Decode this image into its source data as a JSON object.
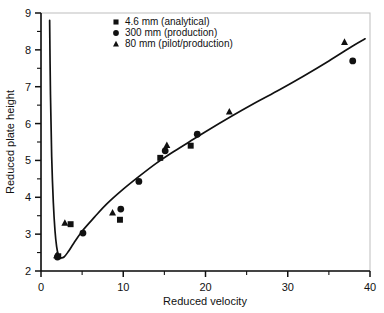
{
  "chart_data": {
    "type": "scatter",
    "title": "",
    "xlabel": "Reduced velocity",
    "ylabel": "Reduced plate height",
    "xlim": [
      0,
      40
    ],
    "ylim": [
      2,
      9
    ],
    "xticks": [
      "0",
      "10",
      "20",
      "30",
      "40"
    ],
    "xtick_values": [
      0,
      10,
      20,
      30,
      40
    ],
    "xminor_step": 5,
    "yticks": [
      "2",
      "3",
      "4",
      "5",
      "6",
      "7",
      "8",
      "9"
    ],
    "ytick_values": [
      2,
      3,
      4,
      5,
      6,
      7,
      8,
      9
    ],
    "yminor_step": 0.5,
    "grid": false,
    "legend_position": "top-center",
    "series": [
      {
        "name": "4.6 mm (analytical)",
        "marker": "square",
        "color": "#111111",
        "points": [
          {
            "x": 2.1,
            "y": 2.4
          },
          {
            "x": 3.6,
            "y": 3.27
          },
          {
            "x": 9.6,
            "y": 3.39
          },
          {
            "x": 14.5,
            "y": 5.07
          },
          {
            "x": 18.2,
            "y": 5.4
          }
        ]
      },
      {
        "name": "300 mm (production)",
        "marker": "circle",
        "color": "#111111",
        "points": [
          {
            "x": 2.0,
            "y": 2.38
          },
          {
            "x": 5.1,
            "y": 3.03
          },
          {
            "x": 9.7,
            "y": 3.68
          },
          {
            "x": 11.9,
            "y": 4.43
          },
          {
            "x": 15.1,
            "y": 5.26
          },
          {
            "x": 19.0,
            "y": 5.71
          },
          {
            "x": 37.9,
            "y": 7.7
          }
        ]
      },
      {
        "name": "80 mm (pilot/production)",
        "marker": "triangle",
        "color": "#111111",
        "points": [
          {
            "x": 1.9,
            "y": 2.42
          },
          {
            "x": 2.9,
            "y": 3.3
          },
          {
            "x": 8.7,
            "y": 3.58
          },
          {
            "x": 15.3,
            "y": 5.41
          },
          {
            "x": 22.9,
            "y": 6.32
          },
          {
            "x": 36.9,
            "y": 8.21
          }
        ]
      }
    ],
    "fit_curve": {
      "name": "fitted curve",
      "color": "#111111",
      "points": [
        {
          "x": 1.05,
          "y": 8.8
        },
        {
          "x": 1.15,
          "y": 6.8
        },
        {
          "x": 1.3,
          "y": 5.1
        },
        {
          "x": 1.5,
          "y": 3.85
        },
        {
          "x": 1.7,
          "y": 3.1
        },
        {
          "x": 1.9,
          "y": 2.66
        },
        {
          "x": 2.1,
          "y": 2.45
        },
        {
          "x": 2.4,
          "y": 2.36
        },
        {
          "x": 2.8,
          "y": 2.38
        },
        {
          "x": 3.3,
          "y": 2.52
        },
        {
          "x": 4.0,
          "y": 2.76
        },
        {
          "x": 5.0,
          "y": 3.08
        },
        {
          "x": 6.5,
          "y": 3.46
        },
        {
          "x": 8.0,
          "y": 3.82
        },
        {
          "x": 10.0,
          "y": 4.22
        },
        {
          "x": 12.0,
          "y": 4.58
        },
        {
          "x": 14.0,
          "y": 4.92
        },
        {
          "x": 16.0,
          "y": 5.22
        },
        {
          "x": 18.0,
          "y": 5.5
        },
        {
          "x": 20.0,
          "y": 5.78
        },
        {
          "x": 23.0,
          "y": 6.18
        },
        {
          "x": 26.0,
          "y": 6.56
        },
        {
          "x": 29.0,
          "y": 6.92
        },
        {
          "x": 32.0,
          "y": 7.3
        },
        {
          "x": 35.0,
          "y": 7.7
        },
        {
          "x": 38.0,
          "y": 8.12
        },
        {
          "x": 39.4,
          "y": 8.3
        }
      ]
    }
  },
  "legend": {
    "items": [
      {
        "label": "4.6 mm (analytical)",
        "marker": "square"
      },
      {
        "label": "300 mm (production)",
        "marker": "circle"
      },
      {
        "label": "80 mm (pilot/production)",
        "marker": "triangle"
      }
    ]
  },
  "axes": {
    "x_title": "Reduced velocity",
    "y_title": "Reduced plate height"
  }
}
